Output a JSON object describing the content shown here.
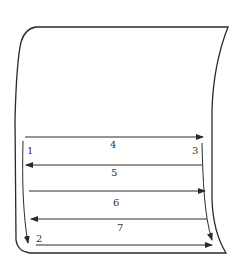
{
  "diagram": {
    "type": "scanning-path",
    "colors": {
      "stroke": "#2a2a2a",
      "label": "#333333",
      "background": "#ffffff"
    },
    "labels": {
      "l1": "1",
      "l2": "2",
      "l3": "3",
      "l4": "4",
      "l5": "5",
      "l6": "6",
      "l7": "7"
    },
    "arrows": [
      {
        "label": "4",
        "direction": "right"
      },
      {
        "label": "5",
        "direction": "left"
      },
      {
        "label": "6",
        "direction": "right"
      },
      {
        "label": "7",
        "direction": "left"
      },
      {
        "label": "2",
        "direction": "right"
      },
      {
        "label": "1",
        "direction": "down"
      },
      {
        "label": "3",
        "direction": "down"
      }
    ]
  }
}
